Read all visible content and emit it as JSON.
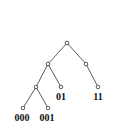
{
  "diagram": {
    "type": "binary-trie",
    "nodes": [
      {
        "id": "root",
        "x": 67,
        "y": 43,
        "label": ""
      },
      {
        "id": "0",
        "x": 48,
        "y": 64,
        "label": ""
      },
      {
        "id": "1",
        "x": 86,
        "y": 64,
        "label": ""
      },
      {
        "id": "00",
        "x": 36,
        "y": 87,
        "label": ""
      },
      {
        "id": "01",
        "x": 61,
        "y": 87,
        "label": "01"
      },
      {
        "id": "11",
        "x": 98,
        "y": 87,
        "label": "11"
      },
      {
        "id": "000",
        "x": 23,
        "y": 108,
        "label": "000"
      },
      {
        "id": "001",
        "x": 48,
        "y": 108,
        "label": "001"
      }
    ],
    "edges": [
      [
        "root",
        "0"
      ],
      [
        "root",
        "1"
      ],
      [
        "0",
        "00"
      ],
      [
        "0",
        "01"
      ],
      [
        "1",
        "11"
      ],
      [
        "00",
        "000"
      ],
      [
        "00",
        "001"
      ]
    ],
    "labels": {
      "l01": "01",
      "l11": "11",
      "l000": "000",
      "l001": "001"
    }
  }
}
